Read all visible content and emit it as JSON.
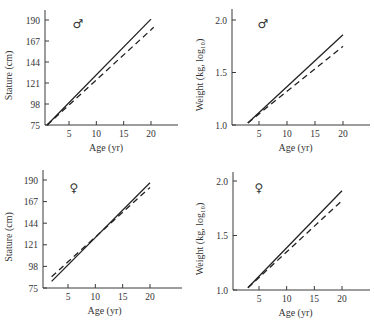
{
  "chart_data": [
    {
      "type": "line",
      "panel": "top-left",
      "sex_symbol": "♂",
      "sex": "male",
      "title": "",
      "xlabel": "Age (yr)",
      "ylabel": "Stature (cm)",
      "xlim": [
        0,
        25
      ],
      "ylim": [
        75,
        198
      ],
      "xticks": [
        5,
        10,
        15,
        20
      ],
      "yticks": [
        75,
        98,
        121,
        144,
        167,
        190
      ],
      "xtick_labels": [
        "5",
        "10",
        "15",
        "20"
      ],
      "ytick_labels": [
        "75",
        "98",
        "121",
        "144",
        "167",
        "190"
      ],
      "series": [
        {
          "name": "solid",
          "style": "solid",
          "x": [
            1,
            20
          ],
          "y": [
            75,
            191
          ]
        },
        {
          "name": "dashed",
          "style": "dashed",
          "x": [
            1,
            20.5
          ],
          "y": [
            75,
            182
          ]
        }
      ]
    },
    {
      "type": "line",
      "panel": "top-right",
      "sex_symbol": "♂",
      "sex": "male",
      "title": "",
      "xlabel": "Age (yr)",
      "ylabel": "Weight (kg, log₁₀)",
      "xlim": [
        0,
        25
      ],
      "ylim": [
        1.0,
        2.1
      ],
      "xticks": [
        5,
        10,
        15,
        20
      ],
      "yticks": [
        1.0,
        1.5,
        2.0
      ],
      "xtick_labels": [
        "5",
        "10",
        "15",
        "20"
      ],
      "ytick_labels": [
        "1.0",
        "1.5",
        "2.0"
      ],
      "series": [
        {
          "name": "solid",
          "style": "solid",
          "x": [
            3,
            20
          ],
          "y": [
            1.02,
            1.86
          ]
        },
        {
          "name": "dashed",
          "style": "dashed",
          "x": [
            3,
            20
          ],
          "y": [
            1.02,
            1.75
          ]
        }
      ]
    },
    {
      "type": "line",
      "panel": "bottom-left",
      "sex_symbol": "♀",
      "sex": "female",
      "title": "",
      "xlabel": "Age (yr)",
      "ylabel": "Stature (cm)",
      "xlim": [
        0,
        25
      ],
      "ylim": [
        75,
        198
      ],
      "xticks": [
        5,
        10,
        15,
        20
      ],
      "yticks": [
        75,
        98,
        121,
        144,
        167,
        190
      ],
      "xtick_labels": [
        "5",
        "10",
        "15",
        "20"
      ],
      "ytick_labels": [
        "75",
        "98",
        "121",
        "144",
        "167",
        "190"
      ],
      "series": [
        {
          "name": "solid",
          "style": "solid",
          "x": [
            2,
            20
          ],
          "y": [
            82,
            187
          ]
        },
        {
          "name": "dashed",
          "style": "dashed",
          "x": [
            2,
            20
          ],
          "y": [
            87,
            182
          ]
        }
      ]
    },
    {
      "type": "line",
      "panel": "bottom-right",
      "sex_symbol": "♀",
      "sex": "female",
      "title": "",
      "xlabel": "Age (yr)",
      "ylabel": "Weight (kg, log₁₀)",
      "xlim": [
        0,
        25
      ],
      "ylim": [
        1.0,
        2.1
      ],
      "xticks": [
        5,
        10,
        15,
        20
      ],
      "yticks": [
        1.0,
        1.5,
        2.0
      ],
      "xtick_labels": [
        "5",
        "10",
        "15",
        "20"
      ],
      "ytick_labels": [
        "1.0",
        "1.5",
        "2.0"
      ],
      "series": [
        {
          "name": "solid",
          "style": "solid",
          "x": [
            3,
            20
          ],
          "y": [
            1.02,
            1.91
          ]
        },
        {
          "name": "dashed",
          "style": "dashed",
          "x": [
            3,
            20
          ],
          "y": [
            1.02,
            1.82
          ]
        }
      ]
    }
  ]
}
